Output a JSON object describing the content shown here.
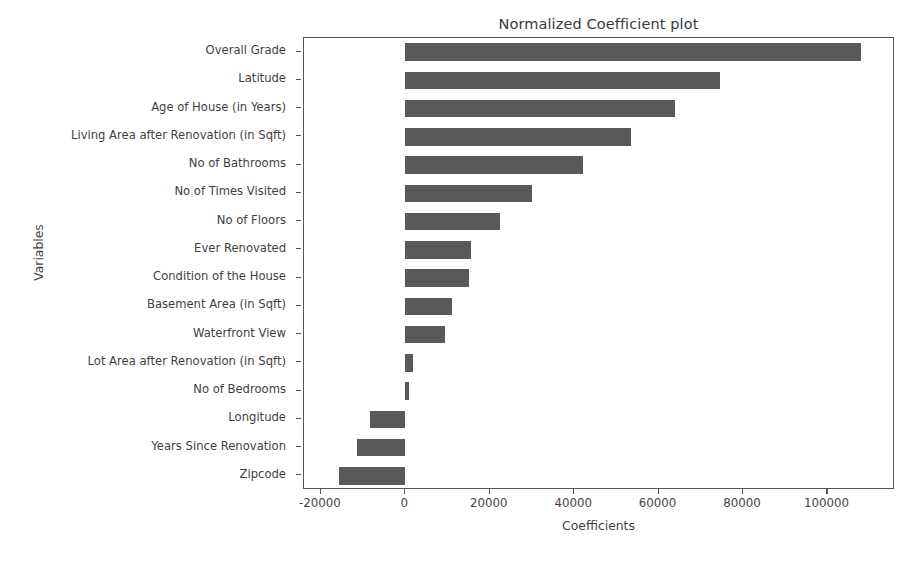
{
  "chart_data": {
    "type": "bar",
    "orientation": "horizontal",
    "title": "Normalized Coefficient plot",
    "xlabel": "Coefficients",
    "ylabel": "Variables",
    "xlim": [
      -24000,
      116000
    ],
    "xticks": [
      -20000,
      0,
      20000,
      40000,
      60000,
      80000,
      100000
    ],
    "xticklabels": [
      "-20000",
      "0",
      "20000",
      "40000",
      "60000",
      "80000",
      "100000"
    ],
    "grid": false,
    "legend": null,
    "bar_color": "#595959",
    "categories": [
      "Overall Grade",
      "Latitude",
      "Age of House (in Years)",
      "Living Area after Renovation (in Sqft)",
      "No of Bathrooms",
      "No of Times Visited",
      "No of Floors",
      "Ever Renovated",
      "Condition of the House",
      "Basement Area (in Sqft)",
      "Waterfront View",
      "Lot Area after Renovation (in Sqft)",
      "No of Bedrooms",
      "Longitude",
      "Years Since Renovation",
      "Zipcode"
    ],
    "values": [
      108000,
      74500,
      64000,
      53500,
      42000,
      30000,
      22500,
      15500,
      15000,
      11000,
      9500,
      1800,
      800,
      -8400,
      -11500,
      -15600
    ]
  }
}
